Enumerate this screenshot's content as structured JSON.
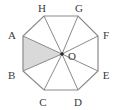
{
  "figure": {
    "type": "regular-octagon-with-center",
    "background_color": "#ffffff",
    "stroke_color": "#8a8a8a",
    "stroke_width": 1,
    "shaded_fill_color": "#d9d9d9",
    "label_color": "#3a3a3a",
    "center": {
      "name": "O",
      "label": "O",
      "x": 62,
      "y": 54,
      "dot_radius": 1.8,
      "label_x": 67,
      "label_y": 58
    },
    "vertices": [
      {
        "name": "A",
        "label": "A",
        "x": 23,
        "y": 36,
        "label_x": 8,
        "label_y": 36
      },
      {
        "name": "B",
        "label": "B",
        "x": 23,
        "y": 71,
        "label_x": 8,
        "label_y": 76
      },
      {
        "name": "C",
        "label": "C",
        "x": 44,
        "y": 90,
        "label_x": 40,
        "label_y": 104
      },
      {
        "name": "D",
        "label": "D",
        "x": 78,
        "y": 90,
        "label_x": 75,
        "label_y": 104
      },
      {
        "name": "E",
        "label": "E",
        "x": 98,
        "y": 71,
        "label_x": 103,
        "label_y": 76
      },
      {
        "name": "F",
        "label": "F",
        "x": 98,
        "y": 36,
        "label_x": 103,
        "label_y": 36
      },
      {
        "name": "G",
        "label": "G",
        "x": 78,
        "y": 16,
        "label_x": 76,
        "label_y": 11
      },
      {
        "name": "H",
        "label": "H",
        "x": 44,
        "y": 16,
        "label_x": 38,
        "label_y": 11
      }
    ],
    "octagon_outline_points": "23,36 23,71 44,90 78,90 98,71 98,36 78,16 44,16",
    "radii": [
      {
        "from": "O",
        "to": "A"
      },
      {
        "from": "O",
        "to": "B"
      },
      {
        "from": "O",
        "to": "C"
      },
      {
        "from": "O",
        "to": "D"
      },
      {
        "from": "O",
        "to": "E"
      },
      {
        "from": "O",
        "to": "F"
      },
      {
        "from": "O",
        "to": "G"
      },
      {
        "from": "O",
        "to": "H"
      }
    ],
    "shaded_region": {
      "name": "triangle-AOB",
      "vertices": [
        "A",
        "O",
        "B"
      ],
      "points": "23,36 62,54 23,71"
    }
  }
}
